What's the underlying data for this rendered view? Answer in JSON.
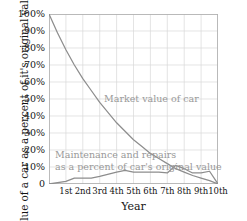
{
  "chart_data": {
    "type": "line",
    "title": "",
    "xlabel": "Year",
    "ylabel": "Value of a car as a percent of it's original value",
    "xlim": [
      0,
      10
    ],
    "ylim": [
      0,
      100
    ],
    "grid": true,
    "legend_position": "in-plot annotations",
    "x_tick_labels": [
      "1st",
      "2nd",
      "3rd",
      "4th",
      "5th",
      "6th",
      "7th",
      "8th",
      "9th",
      "10th"
    ],
    "x_tick_values": [
      1,
      2,
      3,
      4,
      5,
      6,
      7,
      8,
      9,
      10
    ],
    "y_tick_labels": [
      "0",
      "10%",
      "20%",
      "30%",
      "40%",
      "50%",
      "60%",
      "70%",
      "80%",
      "90%",
      "100%"
    ],
    "y_tick_values": [
      0,
      10,
      20,
      30,
      40,
      50,
      60,
      70,
      80,
      90,
      100
    ],
    "series": [
      {
        "name": "Market value of car",
        "color": "#8d8d8d",
        "annotation": "Market value of car",
        "x": [
          0,
          0.5,
          1,
          1.5,
          2,
          2.5,
          3,
          3.5,
          4,
          4.5,
          5,
          5.5,
          6,
          6.5,
          7,
          7.5,
          8,
          8.5,
          9,
          9.5,
          10
        ],
        "values": [
          100,
          89,
          79,
          70,
          62,
          55,
          48,
          42,
          36,
          31,
          26,
          22,
          18,
          15,
          12,
          9,
          7,
          5,
          3.5,
          2,
          0
        ]
      },
      {
        "name": "Maintenance and repairs as a percent of car's original value",
        "color": "#8d8d8d",
        "annotation": "Maintenance and repairs\nas a percent of car's original value",
        "x": [
          0,
          1,
          1.5,
          2,
          2.5,
          3,
          4,
          4.5,
          5,
          6,
          6.5,
          7,
          7.5,
          8,
          8.5,
          9,
          9.5,
          10
        ],
        "values": [
          0,
          1.5,
          3.5,
          3.5,
          3.5,
          4.5,
          7,
          8,
          7,
          7,
          7,
          6.5,
          11,
          9,
          6.5,
          6.5,
          7.5,
          0
        ]
      }
    ],
    "annotations": [
      {
        "id": "market",
        "text": "Market value of car"
      },
      {
        "id": "maint_line1",
        "text": "Maintenance and repairs"
      },
      {
        "id": "maint_line2",
        "text": "as a percent of car's original value"
      }
    ]
  },
  "axes": {
    "ylabel": "Value of a car as a percent of it's original value",
    "xlabel": "Year"
  },
  "style": {
    "line_color": "#8d8d8d",
    "annotation_color": "#999999",
    "grid_color": "#d8d8d8",
    "frame_color": "#b0b0b0",
    "background": "#ffffff",
    "text_color": "#141414"
  }
}
